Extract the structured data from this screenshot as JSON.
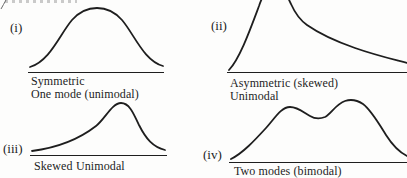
{
  "figure": {
    "colors": {
      "ink": "#1e1e1e",
      "paper": "#fdfdfc"
    },
    "panels": [
      {
        "label": "(i)",
        "caption1": "Symmetric",
        "caption2": "One mode (unimodal)"
      },
      {
        "label": "(ii)",
        "caption1": "Asymmetric (skewed)",
        "caption2": "Unimodal"
      },
      {
        "label": "(iii)",
        "caption1": "Skewed",
        "caption2": "Unimodal"
      },
      {
        "label": "(iv)",
        "caption1": "Two modes (bimodal)"
      }
    ]
  }
}
